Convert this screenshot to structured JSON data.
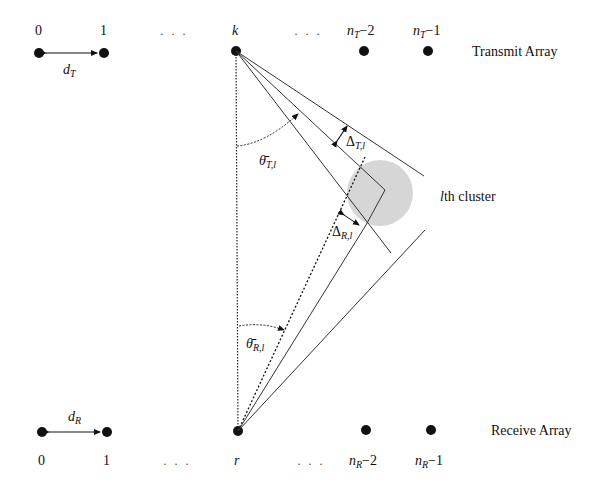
{
  "transmit": {
    "title": "Transmit Array",
    "indices": [
      "0",
      "1",
      "k",
      "n_T−2",
      "n_T−1"
    ],
    "label_0": "0",
    "label_1": "1",
    "label_k": "k",
    "label_nm2_base": "n",
    "label_nm2_sub": "T",
    "label_nm2_rest": "−2",
    "label_nm1_base": "n",
    "label_nm1_sub": "T",
    "label_nm1_rest": "−1",
    "ellipsis": "· · ·",
    "spacing_base": "d",
    "spacing_sub": "T"
  },
  "receive": {
    "title": "Receive Array",
    "label_0": "0",
    "label_1": "1",
    "label_r": "r",
    "label_nm2_base": "n",
    "label_nm2_sub": "R",
    "label_nm2_rest": "−2",
    "label_nm1_base": "n",
    "label_nm1_sub": "R",
    "label_nm1_rest": "−1",
    "ellipsis": "· · ·",
    "spacing_base": "d",
    "spacing_sub": "R"
  },
  "cluster": {
    "label_l": "l",
    "label_rest": "th cluster",
    "fill": "#d6d6d6"
  },
  "angles": {
    "theta_T_base": "θ̄",
    "theta_T_sub": "T,l",
    "theta_R_base": "θ̄",
    "theta_R_sub": "R,l",
    "delta_T_base": "Δ",
    "delta_T_sub": "T,l",
    "delta_R_base": "Δ",
    "delta_R_sub": "R,l"
  },
  "colors": {
    "ink": "#111111",
    "line": "#333333",
    "cluster": "#d6d6d6"
  }
}
